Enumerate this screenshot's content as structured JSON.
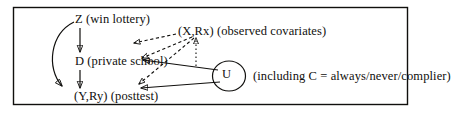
{
  "figure": {
    "kind": "causal-dag",
    "border_color": "#100f0d",
    "ink_color": "#100f0d",
    "background": "#ffffff"
  },
  "nodes": {
    "z": {
      "id": "Z",
      "label": "Z (win lottery)"
    },
    "d": {
      "id": "D",
      "label": "D (private school)"
    },
    "y": {
      "id": "(Y,Ry)",
      "label": "(Y,Ry) (posttest)"
    },
    "x": {
      "id": "(X,Rx)",
      "label": "(X,Rx) (observed covariates)"
    },
    "u": {
      "id": "U",
      "label": "U",
      "note": "(including C = always/never/complier)"
    }
  },
  "edges": [
    {
      "from": "Z",
      "to": "D",
      "style": "solid",
      "shape": "straight"
    },
    {
      "from": "D",
      "to": "(Y,Ry)",
      "style": "solid",
      "shape": "straight"
    },
    {
      "from": "Z",
      "to": "(Y,Ry)",
      "style": "solid",
      "shape": "curved"
    },
    {
      "from": "(X,Rx)",
      "to": "D",
      "style": "dashed",
      "shape": "straight"
    },
    {
      "from": "(X,Rx)",
      "to": "(Y,Ry)",
      "style": "dashed",
      "shape": "straight"
    },
    {
      "from": "(X,Rx)",
      "to": "Z",
      "style": "dashed",
      "shape": "straight"
    },
    {
      "from": "U",
      "to": "D",
      "style": "solid",
      "shape": "straight"
    },
    {
      "from": "U",
      "to": "(Y,Ry)",
      "style": "solid",
      "shape": "straight"
    },
    {
      "from": "U",
      "to": "(X,Rx)",
      "style": "dotted",
      "shape": "straight"
    }
  ]
}
